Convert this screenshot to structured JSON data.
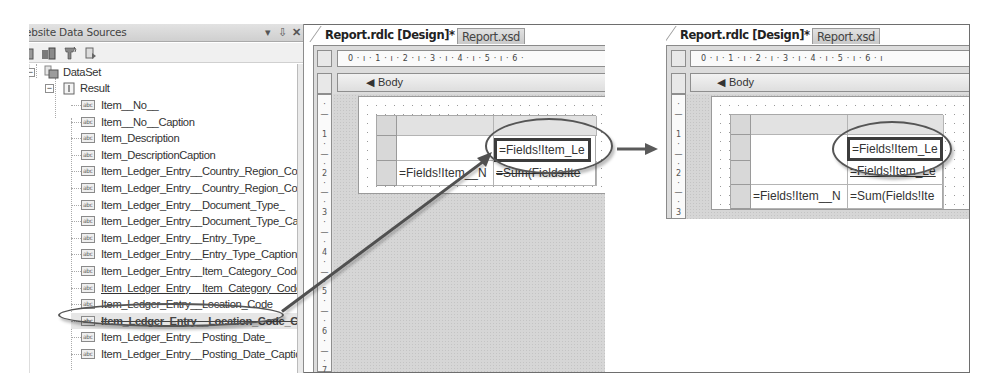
{
  "data_sources_panel": {
    "title": "Website Data Sources",
    "title_visible": "ebsite Data Sources",
    "controls": {
      "pin_dropdown": "▾",
      "auto_hide": "⇩",
      "close": "✕"
    },
    "toolbar_icons": [
      "add-data-source-icon",
      "edit-dataset-icon",
      "configure-dataset-icon",
      "refresh-icon"
    ],
    "tree": {
      "root": {
        "label": "DataSet",
        "expanded": true,
        "children": [
          {
            "label": "Result",
            "expanded": true,
            "fields": [
              "Item__No__",
              "Item__No__Caption",
              "Item_Description",
              "Item_DescriptionCaption",
              "Item_Ledger_Entry__Country_Region_Co",
              "Item_Ledger_Entry__Country_Region_Co",
              "Item_Ledger_Entry__Document_Type_",
              "Item_Ledger_Entry__Document_Type_Ca",
              "Item_Ledger_Entry__Entry_Type_",
              "Item_Ledger_Entry__Entry_Type_Caption",
              "Item_Ledger_Entry__Item_Category_Code",
              "Item_Ledger_Entry__Item_Category_Code",
              "Item_Ledger_Entry__Location_Code",
              "Item_Ledger_Entry__Location_Code_Cap",
              "Item_Ledger_Entry__Posting_Date_",
              "Item_Ledger_Entry__Posting_Date_Captio"
            ],
            "highlighted_field_index": 12,
            "dragging_field_index": 13
          }
        ]
      }
    }
  },
  "designer_before": {
    "tabs": [
      {
        "label": "Report.rdlc [Design]*",
        "active": true
      },
      {
        "label": "Report.xsd",
        "active": false
      }
    ],
    "ruler_h": "0 · ı · 1 · ı · 2 · ı · 3 · ı · 4 · ı · 5 · ı · 6 ·",
    "ruler_v": [
      "·",
      "—",
      "1",
      "·",
      "—",
      "·",
      "2",
      "·",
      "—",
      "·",
      "3",
      "·",
      "—",
      "·",
      "4",
      "·",
      "—",
      "·",
      "5",
      "·",
      "—",
      "·",
      "6",
      "·",
      "—",
      "·",
      "7"
    ],
    "body_label": "Body",
    "tablix": {
      "rows": [
        [
          "",
          ""
        ],
        [
          "",
          "=Fields!Item_Le"
        ],
        [
          "=Fields!Item__N",
          "=Sum(Fields!Ite"
        ]
      ]
    }
  },
  "designer_after": {
    "tabs": [
      {
        "label": "Report.rdlc [Design]*",
        "active": true
      },
      {
        "label": "Report.xsd",
        "active": false
      }
    ],
    "ruler_h": "0 · ı · 1 · ı · 2 · ı · 3 · ı · 4 · ı · 5 · ı · 6 · ı",
    "ruler_v": [
      "·",
      "—",
      "1",
      "·",
      "—",
      "·",
      "2",
      "·",
      "—",
      "·",
      "3"
    ],
    "body_label": "Body",
    "tablix": {
      "rows": [
        [
          "",
          ""
        ],
        [
          "",
          "=Fields!Item_Le"
        ],
        [
          "",
          "=Fields!Item_Le"
        ],
        [
          "=Fields!Item__N",
          "=Sum(Fields!Ite"
        ]
      ]
    }
  },
  "annotations": {
    "drag_arrow": "from Location_Code field to tablix cell",
    "transition_arrow": "→",
    "colors": {
      "annotation": "#505050",
      "canvas": "#d6d6d6",
      "panel_header": "#d9d9d9"
    }
  }
}
